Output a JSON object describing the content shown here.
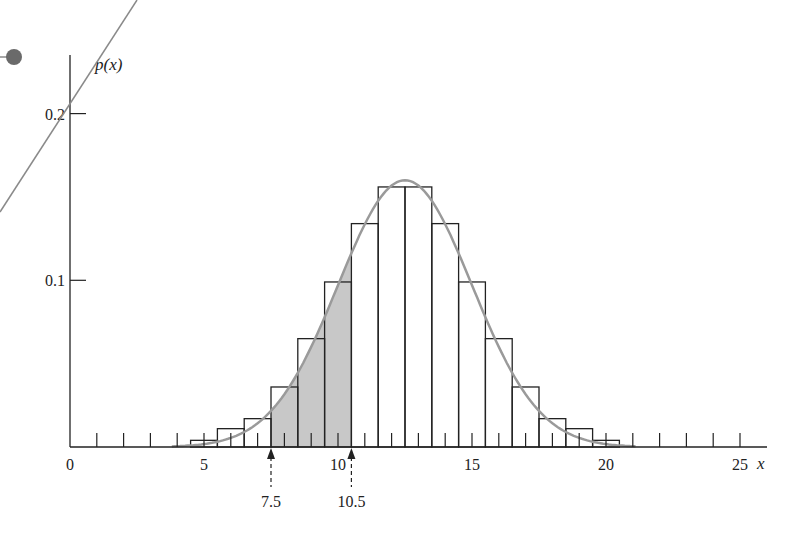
{
  "chart_data": {
    "type": "bar",
    "title": "",
    "xlabel": "x",
    "ylabel": "p(x)",
    "xlim": [
      0,
      26
    ],
    "ylim": [
      0,
      0.2
    ],
    "x_ticks": [
      0,
      5,
      10,
      15,
      20,
      25
    ],
    "x_tick_labels": [
      "0",
      "5",
      "10",
      "15",
      "20",
      "25"
    ],
    "y_ticks": [
      0.1,
      0.2
    ],
    "y_tick_labels": [
      "0.1",
      "0.2"
    ],
    "minor_x_ticks_every": 1,
    "grid": false,
    "legend": null,
    "categories": [
      5,
      6,
      7,
      8,
      9,
      10,
      11,
      12,
      13,
      14,
      15,
      16,
      17,
      18,
      19,
      20
    ],
    "series": [
      {
        "name": "p(x) histogram",
        "values": [
          0.004,
          0.011,
          0.017,
          0.036,
          0.065,
          0.099,
          0.134,
          0.156,
          0.156,
          0.134,
          0.099,
          0.065,
          0.036,
          0.017,
          0.011,
          0.004
        ]
      },
      {
        "name": "normal approximation curve",
        "type": "line",
        "mean": 12.5,
        "sd": 2.5,
        "peak": 0.16
      }
    ],
    "shaded_region": {
      "from": 7.5,
      "to": 10.5,
      "under": "curve"
    },
    "annotations": [
      {
        "x": 7.5,
        "label": "7.5",
        "style": "dashed-arrow"
      },
      {
        "x": 10.5,
        "label": "10.5",
        "style": "dashed-arrow"
      }
    ]
  },
  "colors": {
    "axis": "#222222",
    "bar_stroke": "#222222",
    "bar_fill": "#ffffff",
    "curve": "#9a9a9a",
    "shade": "#c8c8c8",
    "overlay_line": "#8a8a8a",
    "overlay_dot": "#6a6a6a"
  }
}
